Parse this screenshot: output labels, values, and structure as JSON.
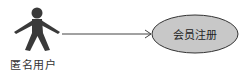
{
  "diagram": {
    "type": "use-case",
    "actor": {
      "label": "匿名用户",
      "icon": "stick-figure-icon"
    },
    "use_case": {
      "label": "会员注册",
      "fill": "#c8c8c8",
      "stroke": "#333333"
    },
    "association": {
      "from": "匿名用户",
      "to": "会员注册",
      "arrow": "open"
    },
    "colors": {
      "actor": "#3a3a3a",
      "line": "#444444",
      "background": "#ffffff"
    }
  }
}
